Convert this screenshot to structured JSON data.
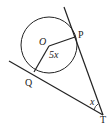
{
  "diagram": {
    "type": "geometry",
    "labels": {
      "center": "O",
      "point_p": "P",
      "point_q": "Q",
      "point_t": "T",
      "angle_center": "5x",
      "angle_t": "x"
    },
    "stroke_color": "#222222"
  }
}
